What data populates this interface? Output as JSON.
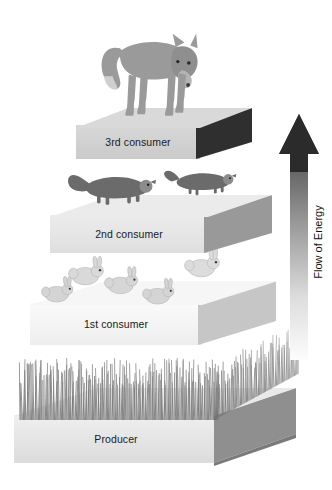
{
  "diagram": {
    "type": "energy-pyramid",
    "background_color": "#ffffff",
    "text_color": "#1a1a1a"
  },
  "levels": [
    {
      "id": "level-3rd-consumer",
      "label": "3rd consumer",
      "tier_index": 4,
      "organism": "fox",
      "organism_count": 1,
      "top_face_color": "#d2d2d2",
      "side_face_color": "#2e2e2e"
    },
    {
      "id": "level-2nd-consumer",
      "label": "2nd consumer",
      "tier_index": 3,
      "organism": "weasel",
      "organism_count": 2,
      "top_face_color": "#e2e2e2",
      "side_face_color": "#8d8d8d"
    },
    {
      "id": "level-1st-consumer",
      "label": "1st consumer",
      "tier_index": 2,
      "organism": "rabbit",
      "organism_count": 5,
      "top_face_color": "#f2f2f2",
      "side_face_color": "#bdbdbd"
    },
    {
      "id": "level-producer",
      "label": "Producer",
      "tier_index": 1,
      "organism": "grass",
      "organism_count": 1,
      "top_face_color": "#e6e6e6",
      "side_face_color": "#8a8a8a"
    }
  ],
  "arrow": {
    "label": "Flow of Energy",
    "direction": "up",
    "head_color": "#2b2b2b",
    "shaft_gradient_top": "#3a3a3a",
    "shaft_gradient_bottom": "#fbfbfb"
  },
  "icons": {
    "fox": "fox-icon",
    "weasel": "weasel-icon",
    "rabbit": "rabbit-icon",
    "grass": "grass-icon",
    "arrow": "up-arrow-icon"
  }
}
